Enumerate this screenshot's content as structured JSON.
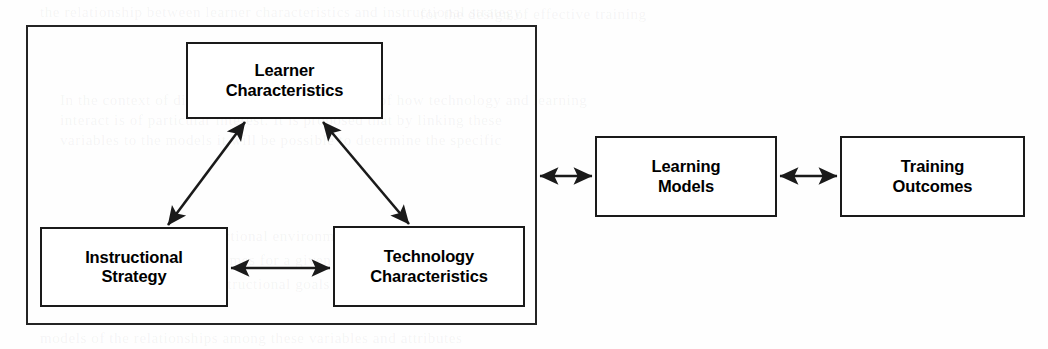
{
  "figure": {
    "type": "conceptual-block-diagram",
    "background_color": "#ffffff",
    "line_color": "#1a1a1a",
    "text_color": "#000000",
    "group": {
      "name": "unlabeled-grouping-frame",
      "x": 26,
      "y": 25,
      "width": 511,
      "height": 300
    },
    "nodes": [
      {
        "id": "learner-characteristics",
        "label": "Learner\nCharacteristics",
        "x": 186,
        "y": 42,
        "width": 197,
        "height": 77
      },
      {
        "id": "instructional-strategy",
        "label": "Instructional\nStrategy",
        "x": 40,
        "y": 227,
        "width": 188,
        "height": 80
      },
      {
        "id": "technology-characteristics",
        "label": "Technology\nCharacteristics",
        "x": 333,
        "y": 226,
        "width": 192,
        "height": 81
      },
      {
        "id": "learning-models",
        "label": "Learning\nModels",
        "x": 595,
        "y": 136,
        "width": 182,
        "height": 81
      },
      {
        "id": "training-outcomes",
        "label": "Training\nOutcomes",
        "x": 840,
        "y": 136,
        "width": 185,
        "height": 81
      }
    ],
    "connectors": [
      {
        "id": "instructional-to-learner",
        "from": "instructional-strategy",
        "to": "learner-characteristics",
        "direction": "bidirectional",
        "style": "diagonal",
        "x1": 168,
        "y1": 225,
        "x2": 245,
        "y2": 122
      },
      {
        "id": "learner-to-technology",
        "from": "learner-characteristics",
        "to": "technology-characteristics",
        "direction": "bidirectional",
        "style": "diagonal",
        "x1": 323,
        "y1": 122,
        "x2": 409,
        "y2": 224
      },
      {
        "id": "instructional-to-technology",
        "from": "instructional-strategy",
        "to": "technology-characteristics",
        "direction": "bidirectional",
        "style": "horizontal",
        "x1": 229,
        "y1": 268,
        "x2": 332,
        "y2": 268
      },
      {
        "id": "group-to-learning-models",
        "from": "unlabeled-grouping-frame",
        "to": "learning-models",
        "direction": "bidirectional",
        "style": "horizontal",
        "x1": 538,
        "y1": 176,
        "x2": 594,
        "y2": 176
      },
      {
        "id": "learning-models-to-training-outcomes",
        "from": "learning-models",
        "to": "training-outcomes",
        "direction": "bidirectional",
        "style": "horizontal",
        "x1": 778,
        "y1": 176,
        "x2": 839,
        "y2": 176
      }
    ]
  },
  "ghost_text": {
    "note": "faint bleed-through from reverse page of the scan",
    "lines": [
      {
        "x": 40,
        "y": 4,
        "text": "the relationship between learner characteristics and instructional strategy"
      },
      {
        "x": 420,
        "y": 6,
        "text": "for the design of effective training"
      },
      {
        "x": 60,
        "y": 92,
        "text": "In the context of distance learning, the question of how technology and learning"
      },
      {
        "x": 60,
        "y": 112,
        "text": "interact is of particular interest. It is proposed that by linking these"
      },
      {
        "x": 60,
        "y": 132,
        "text": "variables to the models it will be possible to determine the specific"
      },
      {
        "x": 60,
        "y": 228,
        "text": "components of the instructional environment that are most likely to"
      },
      {
        "x": 60,
        "y": 252,
        "text": "produce the desired outcomes for a given population of learners"
      },
      {
        "x": 60,
        "y": 276,
        "text": "and a particular set of instructional goals and constraints"
      },
      {
        "x": 40,
        "y": 330,
        "text": "models of the relationships among these variables and attributes"
      }
    ]
  }
}
